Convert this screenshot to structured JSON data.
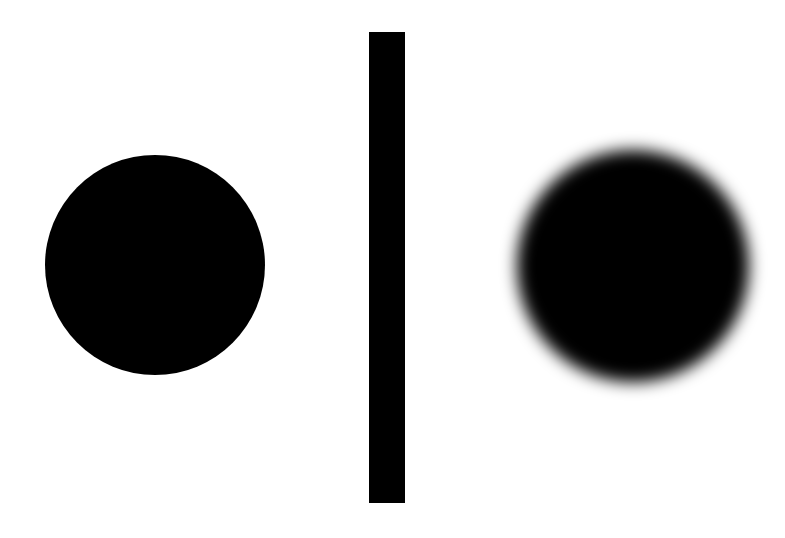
{
  "figure": {
    "width": 785,
    "height": 538,
    "background_color": "#ffffff",
    "foreground_color": "#000000",
    "caption": ""
  },
  "chart_data": {
    "type": "scatter",
    "xlabel": "",
    "ylabel": "",
    "grid": false,
    "legend": "none",
    "xlim": [
      0,
      785
    ],
    "ylim": [
      0,
      538
    ],
    "annotations": [],
    "shapes": [
      {
        "name": "sharp-disc",
        "kind": "circle",
        "fill": "#000000",
        "edge": "sharp",
        "blur_px": 0,
        "center_x": 155,
        "center_y": 265,
        "radius": 110,
        "bbox": [
          45,
          155,
          220,
          220
        ]
      },
      {
        "name": "divider-bar",
        "kind": "rectangle",
        "fill": "#000000",
        "edge": "sharp",
        "blur_px": 0,
        "center_x": 387,
        "center_y": 267,
        "width": 36,
        "height": 471,
        "bbox": [
          369,
          32,
          36,
          471
        ]
      },
      {
        "name": "blurred-disc",
        "kind": "circle",
        "fill": "#000000",
        "edge": "gaussian-blur",
        "blur_px": 8,
        "center_x": 633,
        "center_y": 266,
        "radius": 116,
        "bbox": [
          517,
          150,
          232,
          232
        ]
      }
    ]
  },
  "labels": {
    "left_panel": "",
    "right_panel": ""
  }
}
